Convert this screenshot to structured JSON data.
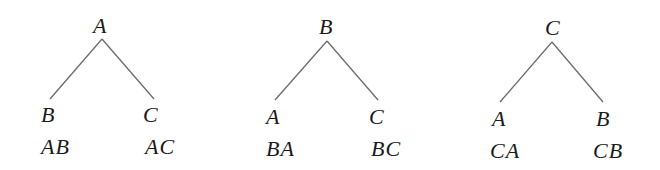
{
  "diagram": {
    "type": "tree-diagram",
    "line_color": "#6b6b6b",
    "text_color": "#1a1a1a",
    "trees": [
      {
        "root": "A",
        "branches": [
          {
            "node": "B",
            "outcome": "AB"
          },
          {
            "node": "C",
            "outcome": "AC"
          }
        ]
      },
      {
        "root": "B",
        "branches": [
          {
            "node": "A",
            "outcome": "BA"
          },
          {
            "node": "C",
            "outcome": "BC"
          }
        ]
      },
      {
        "root": "C",
        "branches": [
          {
            "node": "A",
            "outcome": "CA"
          },
          {
            "node": "B",
            "outcome": "CB"
          }
        ]
      }
    ]
  }
}
